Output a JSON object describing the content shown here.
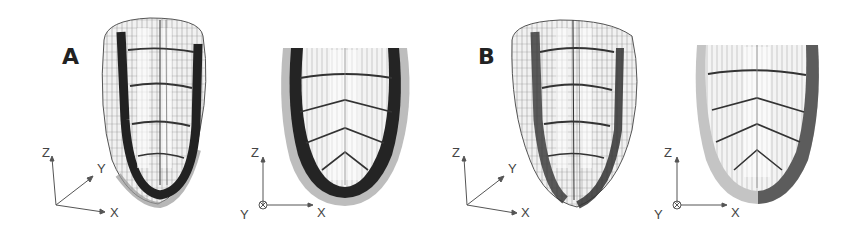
{
  "figure": {
    "panels": [
      {
        "label": "A",
        "views": [
          {
            "name": "oblique-view",
            "axes": {
              "z": "Z",
              "y": "Y",
              "x": "X"
            }
          },
          {
            "name": "front-view",
            "axes": {
              "z": "Z",
              "y": "Y",
              "x": "X"
            }
          }
        ]
      },
      {
        "label": "B",
        "views": [
          {
            "name": "oblique-view",
            "axes": {
              "z": "Z",
              "y": "Y",
              "x": "X"
            }
          },
          {
            "name": "front-view",
            "axes": {
              "z": "Z",
              "y": "Y",
              "x": "X"
            }
          }
        ]
      }
    ],
    "colors": {
      "wire": "#3a3a3a",
      "band_dark": "#262626",
      "shell_gray": "#b5b5b5",
      "axis": "#555555"
    }
  }
}
